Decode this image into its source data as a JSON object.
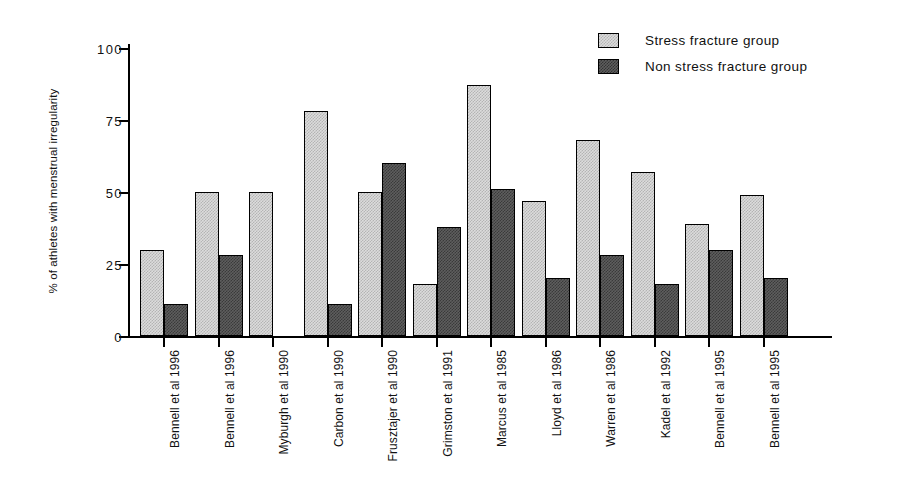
{
  "chart_data": {
    "type": "bar",
    "title": "",
    "xlabel": "",
    "ylabel": "% of athletes with menstrual irregularity",
    "ylim": [
      0,
      100
    ],
    "yticks": [
      0,
      25,
      50,
      75,
      100
    ],
    "ytick_labels": [
      "0",
      "25",
      "50",
      "75",
      "100"
    ],
    "grid": false,
    "legend_position": "top-right",
    "categories": [
      "Bennell et al 1996",
      "Bennell et al 1996",
      "Myburgh et al 1990",
      "Carbon et al 1990",
      "Frusztajer et al 1990",
      "Grimston et al 1991",
      "Marcus et al 1985",
      "Lloyd et al 1986",
      "Warren et al 1986",
      "Kadel et al 1992",
      "Bennell et al 1995",
      "Bennell et al 1995"
    ],
    "series": [
      {
        "name": "Stress fracture group",
        "color": "#dcdcdc",
        "values": [
          30,
          50,
          50,
          78,
          50,
          18,
          87,
          47,
          68,
          57,
          39,
          49
        ]
      },
      {
        "name": "Non stress fracture group",
        "color": "#5e5e5e",
        "values": [
          11,
          28,
          0,
          11,
          60,
          38,
          51,
          20,
          28,
          18,
          30,
          20
        ]
      }
    ]
  },
  "legend": {
    "items": [
      {
        "label": "Stress fracture group",
        "swatch": "light"
      },
      {
        "label": "Non stress fracture group",
        "swatch": "dark"
      }
    ]
  }
}
